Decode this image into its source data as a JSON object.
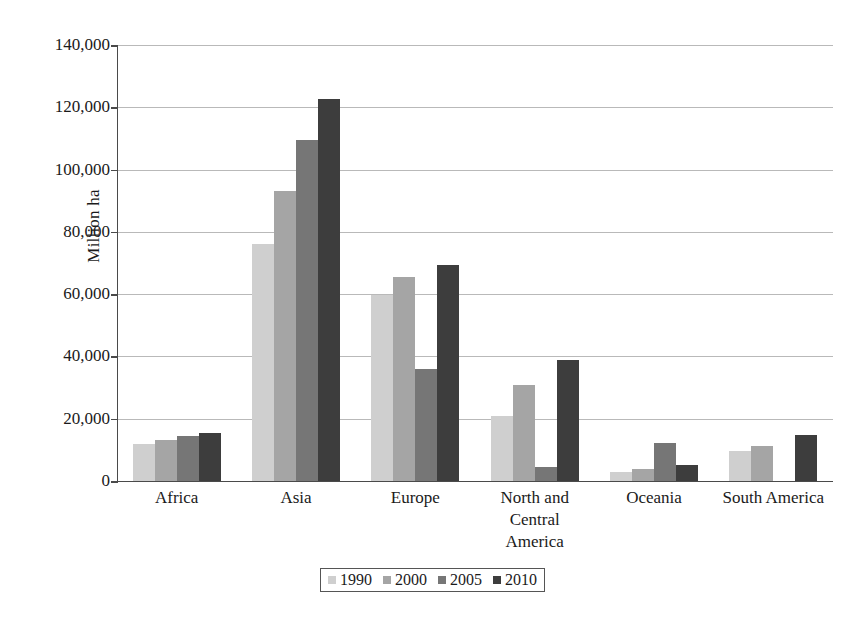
{
  "chart_data": {
    "type": "bar",
    "title": "",
    "subtitle": "",
    "xlabel": "",
    "ylabel": "Million ha",
    "ylim": [
      0,
      140000
    ],
    "ytick_labels": [
      "0",
      "20,000",
      "40,000",
      "60,000",
      "80,000",
      "100,000",
      "120,000",
      "140,000"
    ],
    "ytick_values": [
      0,
      20000,
      40000,
      60000,
      80000,
      100000,
      120000,
      140000
    ],
    "grid": "horizontal",
    "legend_position": "bottom",
    "categories": [
      "Africa",
      "Asia",
      "Europe",
      "North and\nCentral\nAmerica",
      "Oceania",
      "South America"
    ],
    "series": [
      {
        "name": "1990",
        "color": "#cfcfcf",
        "values": [
          11800,
          76000,
          59700,
          21000,
          3000,
          9500
        ]
      },
      {
        "name": "2000",
        "color": "#a5a5a5",
        "values": [
          13200,
          93000,
          65400,
          30900,
          4000,
          11100
        ]
      },
      {
        "name": "2005",
        "color": "#767676",
        "values": [
          14300,
          109500,
          36000,
          4600,
          12100,
          0
        ]
      },
      {
        "name": "2010",
        "color": "#3d3d3d",
        "values": [
          15500,
          122800,
          69400,
          39000,
          5000,
          14900
        ]
      }
    ]
  }
}
